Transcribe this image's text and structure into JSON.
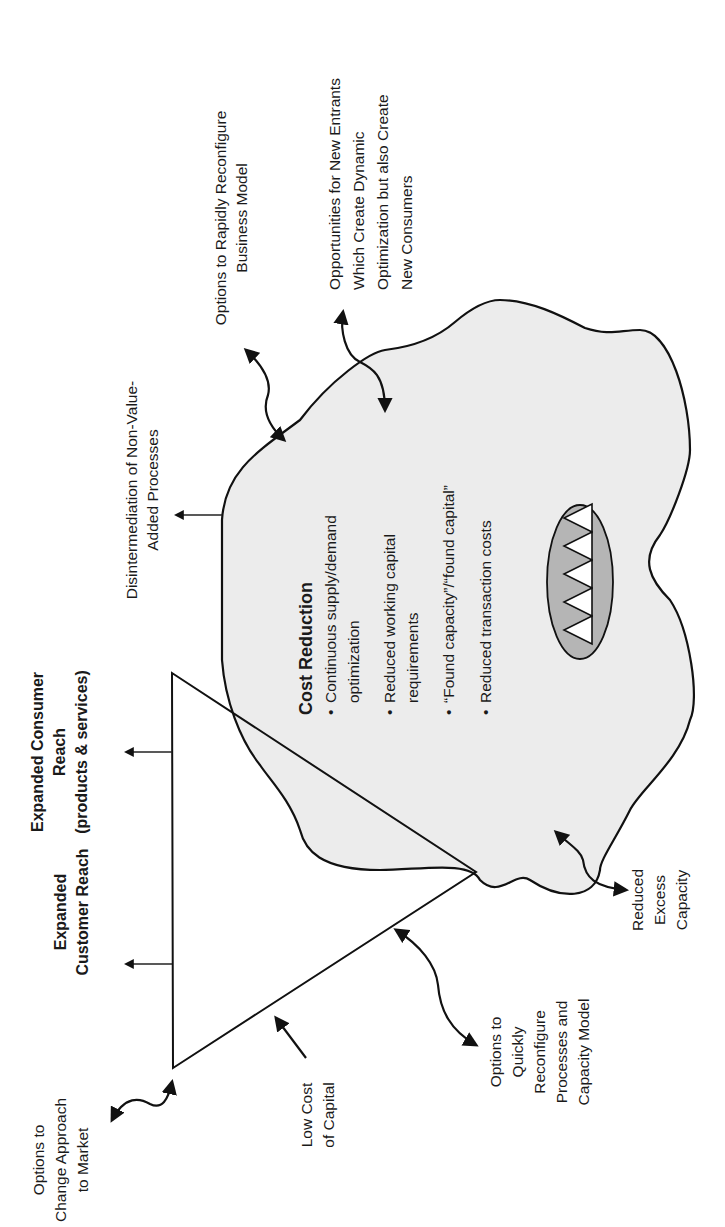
{
  "diagram": {
    "colors": {
      "ink": "#111111",
      "cloud_fill": "#ececec",
      "ellipse_fill": "#b5b5b5",
      "background": "#ffffff"
    },
    "triangle": {
      "labels": {
        "expanded_customer_reach": [
          "Expanded",
          "Customer Reach"
        ],
        "expanded_consumer_reach": [
          "Expanded Consumer",
          "Reach",
          "(products & services)"
        ]
      }
    },
    "cloud": {
      "title": "Cost Reduction",
      "bullets": [
        [
          "Continuous supply/demand",
          "optimization"
        ],
        [
          "Reduced working capital",
          "requirements"
        ],
        [
          "“Found capacity”/“found capital”"
        ],
        [
          "Reduced transaction costs"
        ]
      ],
      "bullet_char": "•",
      "ellipse_triangles": 5
    },
    "annotations": {
      "options_change_approach": [
        "Options to",
        "Change Approach",
        "to Market"
      ],
      "low_cost_capital": [
        "Low Cost",
        "of Capital"
      ],
      "options_quickly_reconfigure": [
        "Options to",
        "Quickly",
        "Reconfigure",
        "Processes and",
        "Capacity Model"
      ],
      "reduced_excess_capacity": [
        "Reduced",
        "Excess",
        "Capacity"
      ],
      "disintermediation": [
        "Disintermediation of Non-Value-",
        "Added Processes"
      ],
      "options_rapidly_reconfigure": [
        "Options to Rapidly Reconfigure",
        "Business Model"
      ],
      "opportunities_new_entrants": [
        "Opportunities for New Entrants",
        "Which Create Dynamic",
        "Optimization but also Create",
        "New Consumers"
      ]
    }
  }
}
